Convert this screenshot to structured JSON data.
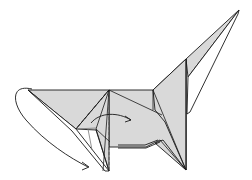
{
  "diagram": {
    "paper_color": "#d9d9d9",
    "line_color": "#1a1a1a",
    "background": "#ffffff",
    "arrows": [
      {
        "name": "swing-arrow-tail",
        "type": "curved-fold-behind"
      },
      {
        "name": "fold-arrow-center",
        "type": "curved-fold-over"
      }
    ],
    "fold_lines": [
      {
        "type": "valley",
        "style": "dashed"
      }
    ]
  }
}
